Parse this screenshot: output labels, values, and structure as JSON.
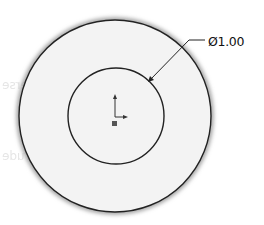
{
  "sketch": {
    "outer_circle": {
      "cx": 115,
      "cy": 116,
      "r": 96,
      "fill": "#f3f3f3",
      "stroke": "#222222"
    },
    "inner_circle": {
      "cx": 116,
      "cy": 116,
      "r": 48,
      "stroke": "#222222"
    },
    "origin": {
      "x": 115,
      "y": 116
    },
    "dimension": {
      "type": "diameter",
      "symbol": "Ø",
      "value": "1.00",
      "label": "Ø1.00"
    }
  },
  "ghost_text": {
    "reverse": "Reverse",
    "extrude": "Extrude",
    "select": "Select..."
  },
  "colors": {
    "background": "#ffffff",
    "sketch_line": "#222222",
    "face_fill": "#f3f3f3"
  }
}
